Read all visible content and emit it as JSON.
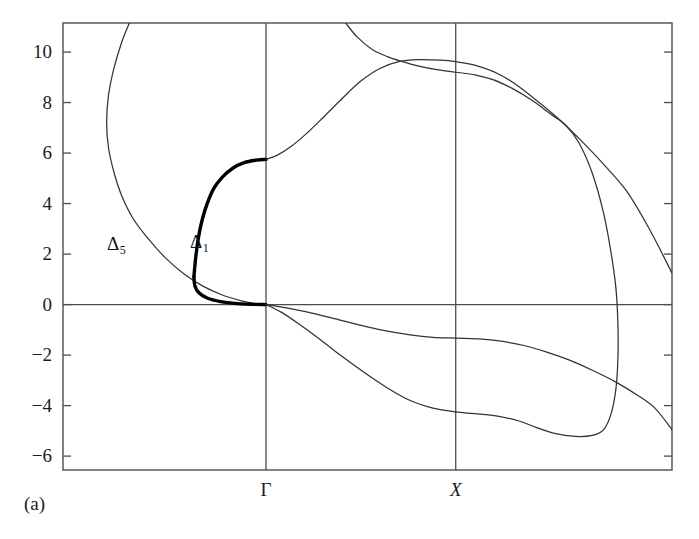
{
  "figure": {
    "panel_caption": "(a)",
    "kind": "band-structure-dispersion"
  },
  "axes": {
    "y_ticks": [
      {
        "label": "10",
        "value": 10
      },
      {
        "label": "8",
        "value": 8
      },
      {
        "label": "6",
        "value": 6
      },
      {
        "label": "4",
        "value": 4
      },
      {
        "label": "2",
        "value": 2
      },
      {
        "label": "0",
        "value": 0
      },
      {
        "label": "−2",
        "value": -2
      },
      {
        "label": "−4",
        "value": -4
      },
      {
        "label": "−6",
        "value": -6
      }
    ],
    "x_ticks": [
      {
        "label": "Γ",
        "value": 0,
        "style": "upright"
      },
      {
        "label": "X",
        "value": 1,
        "style": "italic"
      }
    ],
    "ylim": [
      -6.55,
      11.15
    ],
    "xlim": [
      -1.07,
      2.14
    ],
    "grid": false,
    "frame_color": "#4d4d4d",
    "curve_color": "#333333",
    "highlight_color": "#000000"
  },
  "annotations": [
    {
      "name": "delta5-label",
      "text": "Δ",
      "subscript": "5",
      "x": 107,
      "y": 234
    },
    {
      "name": "delta1-label",
      "text": "Δ",
      "subscript": "1",
      "x": 190,
      "y": 232
    }
  ],
  "chart_data": {
    "type": "line",
    "title": "",
    "xlabel": "",
    "ylabel": "",
    "xlim": [
      -1.07,
      2.14
    ],
    "ylim": [
      -6.55,
      11.15
    ],
    "grid": false,
    "legend": "none",
    "x_tick_labels": [
      "Γ",
      "X"
    ],
    "x_tick_values": [
      0,
      1
    ],
    "y_tick_values": [
      10,
      8,
      6,
      4,
      2,
      0,
      -2,
      -4,
      -6
    ],
    "annotations": [
      "Δ5",
      "Δ1"
    ],
    "series": [
      {
        "name": "Δ5",
        "style": "thin",
        "points": [
          [
            -0.72,
            11.15
          ],
          [
            -0.76,
            10.4
          ],
          [
            -0.8,
            9.4
          ],
          [
            -0.83,
            8.3
          ],
          [
            -0.84,
            7.2
          ],
          [
            -0.83,
            6.2
          ],
          [
            -0.8,
            5.2
          ],
          [
            -0.76,
            4.3
          ],
          [
            -0.7,
            3.4
          ],
          [
            -0.62,
            2.6
          ],
          [
            -0.53,
            1.85
          ],
          [
            -0.43,
            1.2
          ],
          [
            -0.33,
            0.72
          ],
          [
            -0.23,
            0.38
          ],
          [
            -0.13,
            0.15
          ],
          [
            -0.05,
            0.03
          ],
          [
            0.0,
            0.0
          ]
        ]
      },
      {
        "name": "Δ1",
        "style": "thick",
        "points": [
          [
            -0.38,
            1.1
          ],
          [
            -0.37,
            1.9
          ],
          [
            -0.355,
            2.7
          ],
          [
            -0.335,
            3.4
          ],
          [
            -0.31,
            4.0
          ],
          [
            -0.275,
            4.6
          ],
          [
            -0.23,
            5.05
          ],
          [
            -0.175,
            5.4
          ],
          [
            -0.115,
            5.62
          ],
          [
            -0.05,
            5.72
          ],
          [
            0.0,
            5.75
          ]
        ]
      },
      {
        "name": "Δ1-lower-branch-thick",
        "style": "thick",
        "points": [
          [
            -0.38,
            1.1
          ],
          [
            -0.375,
            0.75
          ],
          [
            -0.355,
            0.48
          ],
          [
            -0.31,
            0.26
          ],
          [
            -0.24,
            0.12
          ],
          [
            -0.15,
            0.04
          ],
          [
            -0.07,
            0.01
          ],
          [
            0.0,
            0.0
          ]
        ]
      },
      {
        "name": "upper-band-rising",
        "style": "thin",
        "points": [
          [
            0.0,
            5.75
          ],
          [
            0.06,
            5.92
          ],
          [
            0.13,
            6.25
          ],
          [
            0.21,
            6.75
          ],
          [
            0.3,
            7.4
          ],
          [
            0.4,
            8.15
          ],
          [
            0.5,
            8.85
          ],
          [
            0.6,
            9.35
          ],
          [
            0.7,
            9.62
          ],
          [
            0.8,
            9.7
          ],
          [
            0.92,
            9.68
          ],
          [
            1.0,
            9.62
          ],
          [
            1.1,
            9.48
          ],
          [
            1.22,
            9.15
          ],
          [
            1.33,
            8.65
          ],
          [
            1.44,
            8.0
          ],
          [
            1.55,
            7.3
          ],
          [
            1.66,
            6.5
          ],
          [
            1.78,
            5.55
          ],
          [
            1.9,
            4.5
          ],
          [
            2.02,
            3.0
          ],
          [
            2.14,
            1.25
          ]
        ]
      },
      {
        "name": "upper-band-descending",
        "style": "thin",
        "points": [
          [
            0.42,
            11.15
          ],
          [
            0.48,
            10.6
          ],
          [
            0.56,
            10.1
          ],
          [
            0.64,
            9.82
          ],
          [
            0.72,
            9.62
          ],
          [
            0.8,
            9.45
          ],
          [
            0.9,
            9.3
          ],
          [
            1.0,
            9.2
          ],
          [
            1.1,
            9.1
          ],
          [
            1.2,
            8.9
          ],
          [
            1.3,
            8.55
          ],
          [
            1.4,
            8.1
          ],
          [
            1.5,
            7.55
          ],
          [
            1.58,
            7.1
          ],
          [
            1.65,
            6.4
          ],
          [
            1.72,
            5.2
          ],
          [
            1.78,
            3.6
          ],
          [
            1.82,
            2.0
          ],
          [
            1.845,
            0.6
          ],
          [
            1.855,
            -0.8
          ],
          [
            1.855,
            -2.1
          ],
          [
            1.845,
            -3.3
          ],
          [
            1.82,
            -4.3
          ],
          [
            1.78,
            -4.95
          ],
          [
            1.72,
            -5.18
          ],
          [
            1.63,
            -5.22
          ],
          [
            1.52,
            -5.1
          ],
          [
            1.42,
            -4.85
          ],
          [
            1.33,
            -4.6
          ],
          [
            1.22,
            -4.42
          ],
          [
            1.1,
            -4.32
          ],
          [
            1.0,
            -4.25
          ],
          [
            0.88,
            -4.1
          ],
          [
            0.76,
            -3.8
          ],
          [
            0.64,
            -3.3
          ],
          [
            0.52,
            -2.7
          ],
          [
            0.4,
            -2.05
          ],
          [
            0.28,
            -1.35
          ],
          [
            0.17,
            -0.75
          ],
          [
            0.08,
            -0.3
          ],
          [
            0.0,
            0.0
          ]
        ]
      },
      {
        "name": "lower-band-shallow",
        "style": "thin",
        "points": [
          [
            0.0,
            0.0
          ],
          [
            0.1,
            -0.12
          ],
          [
            0.22,
            -0.3
          ],
          [
            0.34,
            -0.52
          ],
          [
            0.48,
            -0.78
          ],
          [
            0.62,
            -1.02
          ],
          [
            0.76,
            -1.2
          ],
          [
            0.88,
            -1.3
          ],
          [
            1.0,
            -1.33
          ],
          [
            1.12,
            -1.36
          ],
          [
            1.24,
            -1.45
          ],
          [
            1.36,
            -1.62
          ],
          [
            1.48,
            -1.88
          ],
          [
            1.6,
            -2.2
          ],
          [
            1.72,
            -2.6
          ],
          [
            1.84,
            -3.05
          ],
          [
            1.96,
            -3.6
          ],
          [
            2.05,
            -4.1
          ],
          [
            2.14,
            -4.95
          ]
        ]
      }
    ]
  }
}
